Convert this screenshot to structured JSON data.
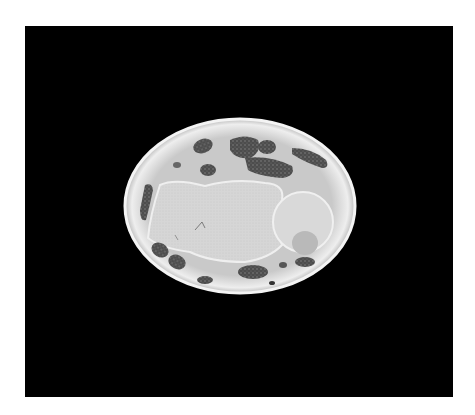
{
  "image": {
    "description": "Grayscale cross-sectional scan of an oval specimen on a black background",
    "background_color": "#000000",
    "page_color": "#ffffff",
    "specimen": {
      "shape": "oval",
      "outer_color": "#e6e6e6",
      "interior_color": "#cfcfcf",
      "large_body_color": "#d8d8d8",
      "dark_region_color": "#4a4a4a"
    }
  }
}
